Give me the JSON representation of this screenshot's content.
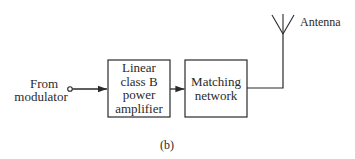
{
  "diagram": {
    "input": {
      "line1": "From",
      "line2": "modulator"
    },
    "blocks": [
      {
        "id": "amplifier",
        "lines": [
          "Linear",
          "class B",
          "power",
          "amplifier"
        ]
      },
      {
        "id": "matching",
        "lines": [
          "Matching",
          "network"
        ]
      }
    ],
    "output": {
      "label": "Antenna"
    },
    "caption": "(b)",
    "colors": {
      "stroke": "#2a2a2a",
      "background": "#ffffff"
    }
  }
}
